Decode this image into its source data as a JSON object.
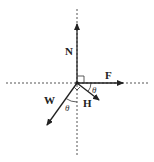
{
  "diagram": {
    "colors": {
      "line": "#222222",
      "dashed": "#555555",
      "background": "#ffffff"
    },
    "origin": {
      "x": 77,
      "y": 83
    },
    "forces": [
      {
        "id": "N",
        "label": "N",
        "direction": "up"
      },
      {
        "id": "F",
        "label": "F",
        "direction": "right"
      },
      {
        "id": "H",
        "label": "H",
        "direction": "down-right"
      },
      {
        "id": "W",
        "label": "W",
        "direction": "down-left"
      }
    ],
    "angles": [
      {
        "id": "theta_H",
        "label": "θ",
        "between": [
          "F",
          "H"
        ]
      },
      {
        "id": "theta_W",
        "label": "θ",
        "between": [
          "W",
          "vertical"
        ]
      }
    ],
    "right_angle_marks": [
      {
        "between": [
          "N",
          "F"
        ]
      },
      {
        "between": [
          "W",
          "H"
        ]
      }
    ],
    "axes": {
      "horizontal": "dashed",
      "vertical": "dashed"
    }
  }
}
